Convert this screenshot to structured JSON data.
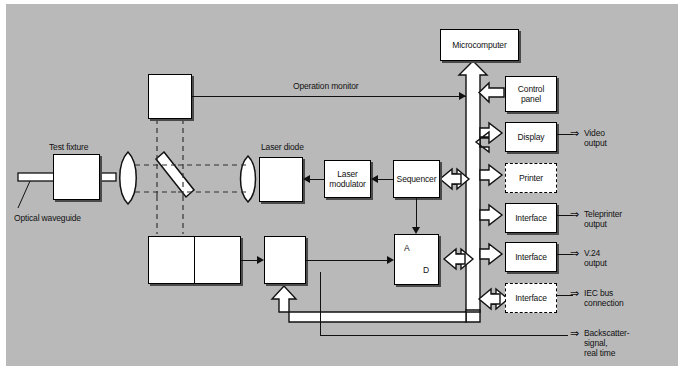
{
  "figure": {
    "background_color": "#b9b9b9",
    "line_color": "#111111",
    "box_fill": "#ffffff"
  },
  "optics": {
    "test_fixture_label": "Test fixture",
    "optical_waveguide_label": "Optical waveguide",
    "laser_diode_label": "Laser diode",
    "beam_splitter_name": "beam-splitter",
    "lens_near_fixture_name": "collimating-lens",
    "lens_near_laser_name": "coupling-lens"
  },
  "blocks": {
    "monitor_photodiode": {
      "symbol": "photodiode",
      "label": ""
    },
    "laser_diode": {
      "symbol": "laser-diode",
      "label": ""
    },
    "laser_modulator": {
      "line1": "Laser",
      "line2": "modulator"
    },
    "sequencer": {
      "label": "Sequencer"
    },
    "detector_photodiode": {
      "symbol": "photodiode"
    },
    "preamplifier": {
      "symbol": "amplifier"
    },
    "gated_amplifier": {
      "symbol": "gated-amplifier"
    },
    "ad_converter": {
      "top_label": "A",
      "bottom_label": "D"
    },
    "microcomputer": {
      "label": "Microcomputer"
    },
    "control_panel": {
      "line1": "Control",
      "line2": "panel"
    },
    "display": {
      "label": "Display"
    },
    "printer": {
      "label": "Printer",
      "border": "dashed"
    },
    "interface_teleprinter": {
      "label": "Interface",
      "border": "solid"
    },
    "interface_v24": {
      "label": "Interface",
      "border": "solid"
    },
    "interface_iec": {
      "label": "Interface",
      "border": "dashed"
    }
  },
  "annotations": {
    "operation_monitor": "Operation monitor",
    "video_output": {
      "line1": "Video",
      "line2": "output"
    },
    "teleprinter_output": {
      "line1": "Teleprinter",
      "line2": "output"
    },
    "v24_output": {
      "line1": "V.24",
      "line2": "output"
    },
    "iec_bus_connection": {
      "line1": "IEC bus",
      "line2": "connection"
    },
    "backscatter_signal": {
      "line1": "Backscatter-",
      "line2": "signal,",
      "line3": "real time"
    }
  }
}
